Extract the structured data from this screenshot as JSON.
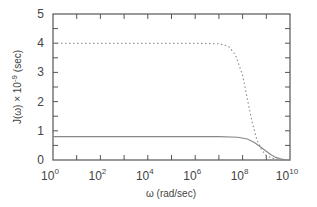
{
  "chart_data": {
    "type": "line",
    "title": "",
    "xlabel": "ω (rad/sec)",
    "ylabel": "J(ω) × 10^-9 (sec)",
    "xscale": "log",
    "xlim": [
      1,
      10000000000
    ],
    "ylim": [
      0,
      5
    ],
    "x_ticks": [
      "10^0",
      "10^2",
      "10^4",
      "10^6",
      "10^8",
      "10^10"
    ],
    "y_ticks": [
      "0",
      "1",
      "2",
      "3",
      "4",
      "5"
    ],
    "grid": false,
    "legend": null,
    "series": [
      {
        "name": "dotted curve",
        "style": "dotted",
        "log10_x": [
          0,
          2,
          4,
          6,
          7,
          7.4,
          7.7,
          8.0,
          8.2,
          8.4,
          8.6,
          8.8,
          9.0,
          9.3,
          9.6,
          10
        ],
        "y": [
          4.0,
          4.0,
          4.0,
          4.0,
          3.98,
          3.9,
          3.6,
          2.9,
          2.1,
          1.3,
          0.7,
          0.35,
          0.15,
          0.05,
          0.01,
          0.0
        ]
      },
      {
        "name": "solid curve",
        "style": "solid",
        "log10_x": [
          0,
          2,
          4,
          6,
          7,
          7.8,
          8.2,
          8.5,
          8.8,
          9.0,
          9.2,
          9.4,
          9.6,
          9.8,
          10
        ],
        "y": [
          0.8,
          0.8,
          0.8,
          0.8,
          0.8,
          0.78,
          0.72,
          0.6,
          0.42,
          0.3,
          0.18,
          0.09,
          0.04,
          0.01,
          0.0
        ]
      }
    ]
  },
  "labels": {
    "x_axis": "ω (rad/sec)",
    "y_axis_main": "J(ω) × 10",
    "y_axis_exp": "-9",
    "y_axis_unit": " (sec)"
  },
  "colors": {
    "axis": "#555555",
    "line": "#888888"
  }
}
